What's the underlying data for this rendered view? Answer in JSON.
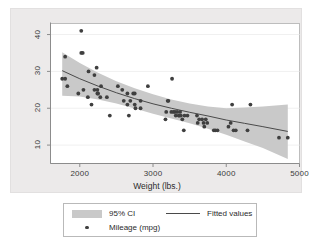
{
  "chart_data": {
    "type": "scatter",
    "title": "",
    "xlabel": "Weight (lbs.)",
    "ylabel": "",
    "xlim": [
      1600,
      5000
    ],
    "ylim": [
      5,
      43
    ],
    "xticks": [
      2000,
      3000,
      4000,
      5000
    ],
    "yticks": [
      10,
      20,
      30,
      40
    ],
    "grid": true,
    "legend_position": "below-plot",
    "legend": [
      {
        "key": "ci",
        "label": "95% CI",
        "marker": "band",
        "color": "#c9c9c9"
      },
      {
        "key": "fit",
        "label": "Fitted values",
        "marker": "line",
        "color": "#4a4a4a"
      },
      {
        "key": "points",
        "label": "Mileage (mpg)",
        "marker": "dot",
        "color": "#3f3f3f"
      }
    ],
    "series": [
      {
        "name": "Mileage (mpg)",
        "type": "scatter",
        "x": [
          1760,
          1800,
          1800,
          1830,
          1980,
          2020,
          2020,
          2040,
          2050,
          2110,
          2120,
          2160,
          2200,
          2200,
          2230,
          2240,
          2240,
          2250,
          2280,
          2290,
          2370,
          2410,
          2520,
          2580,
          2600,
          2650,
          2650,
          2670,
          2690,
          2730,
          2750,
          2750,
          2760,
          2830,
          2830,
          2930,
          3170,
          3180,
          3200,
          3210,
          3250,
          3260,
          3280,
          3300,
          3310,
          3330,
          3350,
          3360,
          3370,
          3380,
          3400,
          3420,
          3430,
          3470,
          3600,
          3610,
          3630,
          3670,
          3690,
          3700,
          3720,
          3740,
          3830,
          3850,
          3880,
          4030,
          4060,
          4080,
          4100,
          4130,
          4290,
          4330,
          4720,
          4840
        ],
        "y": [
          28,
          34,
          28,
          26,
          24,
          41,
          35,
          35,
          25,
          23,
          30,
          21,
          29,
          25,
          31,
          25,
          24,
          24,
          23,
          26,
          23,
          18,
          26,
          25,
          22,
          21,
          24,
          18,
          22,
          24,
          24,
          21,
          20,
          20,
          22,
          26,
          17,
          19,
          22,
          22,
          19,
          28,
          19,
          19,
          18,
          19,
          18,
          18,
          19,
          18,
          17,
          14,
          18,
          18,
          18,
          16,
          17,
          17,
          16,
          15,
          17,
          16,
          14,
          14,
          14,
          15,
          16,
          21,
          14,
          14,
          14,
          21,
          12,
          12
        ]
      },
      {
        "name": "Fitted values",
        "type": "line",
        "x": [
          1760,
          2000,
          2250,
          2500,
          2750,
          3000,
          3250,
          3500,
          3750,
          4000,
          4250,
          4500,
          4840
        ],
        "y": [
          30.2,
          28.0,
          26.0,
          24.2,
          22.6,
          21.2,
          20.0,
          18.9,
          17.9,
          16.8,
          15.9,
          15.0,
          13.7
        ]
      }
    ],
    "confidence_band": {
      "name": "95% CI",
      "level": 0.95,
      "x": [
        1760,
        2000,
        2250,
        2500,
        2750,
        3000,
        3250,
        3500,
        3750,
        4000,
        4250,
        4500,
        4840
      ],
      "upper": [
        35.2,
        32.3,
        29.6,
        27.3,
        25.4,
        23.8,
        22.4,
        21.3,
        20.5,
        20.0,
        20.2,
        20.5,
        21.0
      ],
      "lower": [
        23.4,
        23.2,
        22.4,
        21.3,
        19.9,
        18.5,
        17.2,
        15.9,
        14.4,
        12.8,
        11.0,
        9.2,
        6.2
      ]
    }
  }
}
